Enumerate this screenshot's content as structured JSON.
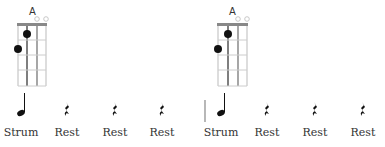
{
  "measures": [
    {
      "chord": {
        "name": "A",
        "strings": 4,
        "frets": 4,
        "open_strings": [
          3,
          4
        ],
        "fingered": [
          {
            "string": 1,
            "fret": 2
          },
          {
            "string": 2,
            "fret": 1
          }
        ]
      },
      "beats": [
        {
          "type": "strum",
          "label": "Strum"
        },
        {
          "type": "rest",
          "label": "Rest"
        },
        {
          "type": "rest",
          "label": "Rest"
        },
        {
          "type": "rest",
          "label": "Rest"
        }
      ]
    },
    {
      "chord": {
        "name": "A",
        "strings": 4,
        "frets": 4,
        "open_strings": [
          3,
          4
        ],
        "fingered": [
          {
            "string": 1,
            "fret": 2
          },
          {
            "string": 2,
            "fret": 1
          }
        ]
      },
      "beats": [
        {
          "type": "strum",
          "label": "Strum"
        },
        {
          "type": "rest",
          "label": "Rest"
        },
        {
          "type": "rest",
          "label": "Rest"
        },
        {
          "type": "rest",
          "label": "Rest"
        }
      ]
    }
  ],
  "colors": {
    "grid": "#bbbbbb",
    "nut": "#888888",
    "dot": "#111111",
    "text": "#333333"
  }
}
